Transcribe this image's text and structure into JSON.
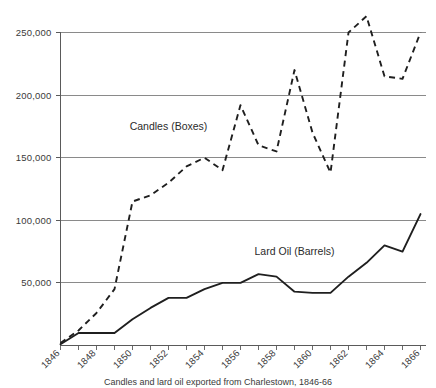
{
  "chart_data": {
    "type": "line",
    "title": "",
    "xlabel": "",
    "ylabel": "",
    "xlim": [
      1846,
      1866
    ],
    "ylim": [
      0,
      265000
    ],
    "grid": true,
    "gridlines_y": [
      50000,
      100000,
      150000,
      200000,
      250000
    ],
    "ytick_labels": [
      "50,000",
      "100,000",
      "150,000",
      "200,000",
      "250,000"
    ],
    "xtick_labels": [
      "1846",
      "1848",
      "1850",
      "1852",
      "1854",
      "1856",
      "1858",
      "1860",
      "1862",
      "1864",
      "1866"
    ],
    "xtick_values": [
      1846,
      1848,
      1850,
      1852,
      1854,
      1856,
      1858,
      1860,
      1862,
      1864,
      1866
    ],
    "x": [
      1846,
      1847,
      1848,
      1849,
      1850,
      1851,
      1852,
      1853,
      1854,
      1855,
      1856,
      1857,
      1858,
      1859,
      1860,
      1861,
      1862,
      1863,
      1864,
      1865,
      1866
    ],
    "legend_position": "inline-annotation",
    "series": [
      {
        "name": "Candles (Boxes)",
        "style": "dashed",
        "label_x": 1852,
        "label_y": 172000,
        "values": [
          2000,
          12000,
          26000,
          45000,
          115000,
          120000,
          130000,
          143000,
          150000,
          140000,
          192000,
          160000,
          155000,
          220000,
          170000,
          138000,
          250000,
          263000,
          215000,
          213000,
          250000
        ]
      },
      {
        "name": "Lard Oil (Barrels)",
        "style": "solid",
        "label_x": 1859,
        "label_y": 72000,
        "values": [
          1000,
          10000,
          10000,
          10000,
          21000,
          30000,
          38000,
          38000,
          45000,
          50000,
          50000,
          57000,
          55000,
          43000,
          42000,
          42000,
          55000,
          66000,
          80000,
          75000,
          105000
        ]
      }
    ]
  },
  "caption": {
    "text": "Candles and lard oil exported from Charlestown, 1846-66"
  }
}
